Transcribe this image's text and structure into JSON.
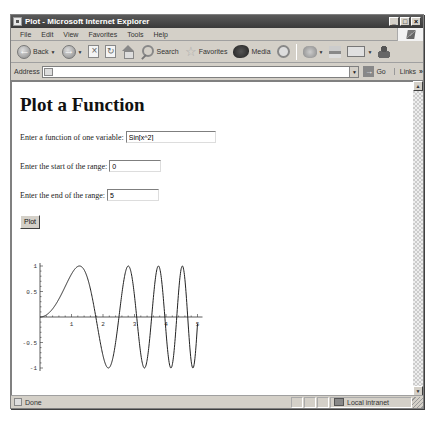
{
  "window": {
    "title": "Plot - Microsoft Internet Explorer",
    "controls": [
      "minimize",
      "maximize",
      "close"
    ]
  },
  "menu": {
    "items": [
      "File",
      "Edit",
      "View",
      "Favorites",
      "Tools",
      "Help"
    ]
  },
  "toolbar": {
    "back_label": "Back",
    "search_label": "Search",
    "favorites_label": "Favorites",
    "media_label": "Media"
  },
  "address": {
    "label": "Address",
    "value": "",
    "go_label": "Go",
    "links_label": "Links"
  },
  "page": {
    "title": "Plot a Function",
    "function_label": "Enter a function of one variable:",
    "function_value": "Sin[x^2]",
    "start_label": "Enter the start of the range:",
    "start_value": "0",
    "end_label": "Enter the end of the range:",
    "end_value": "5",
    "plot_button_label": "Plot"
  },
  "status": {
    "text": "Done",
    "zone": "Local intranet"
  },
  "plot": {
    "function": "Sin[x^2]",
    "x_range": [
      0,
      5
    ],
    "y_range": [
      -1,
      1
    ],
    "x_ticks": [
      "1",
      "2",
      "3",
      "4",
      "5"
    ],
    "y_ticks": [
      "1",
      "0.5",
      "-0.5",
      "-1"
    ],
    "line_color": "#222222"
  }
}
